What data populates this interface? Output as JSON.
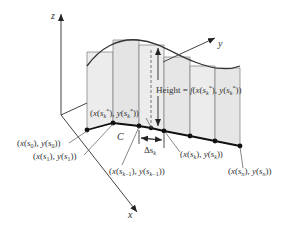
{
  "axes": {
    "x_label": "x",
    "y_label": "y",
    "z_label": "z"
  },
  "curve_label": "C",
  "height_label": "Height = f(x(s",
  "height_label_full": "Height = f(x(s_k*), y(s_k*))",
  "delta_label": "Δs",
  "delta_sub": "k",
  "points": [
    {
      "name": "s0",
      "label": "(x(s",
      "sub": "0",
      "label_full": "(x(s_0), y(s_0))"
    },
    {
      "name": "s1",
      "label": "(x(s",
      "sub": "1",
      "label_full": "(x(s_1), y(s_1))"
    },
    {
      "name": "sk-1",
      "label": "(x(s",
      "sub": "k−1",
      "label_full": "(x(s_{k−1}), y(s_{k−1}))"
    },
    {
      "name": "sk-star",
      "label": "(x(s",
      "sub": "k",
      "label_full": "(x(s_k*), y(s_k*))"
    },
    {
      "name": "sk",
      "label": "(x(s",
      "sub": "k",
      "label_full": "(x(s_k), y(s_k))"
    },
    {
      "name": "sn",
      "label": "(x(s",
      "sub": "n",
      "label_full": "(x(s_n), y(s_n))"
    }
  ],
  "colors": {
    "rect_fill": "#ececec",
    "rect_stroke": "#777777",
    "curve": "#222222",
    "axis": "#444444"
  }
}
